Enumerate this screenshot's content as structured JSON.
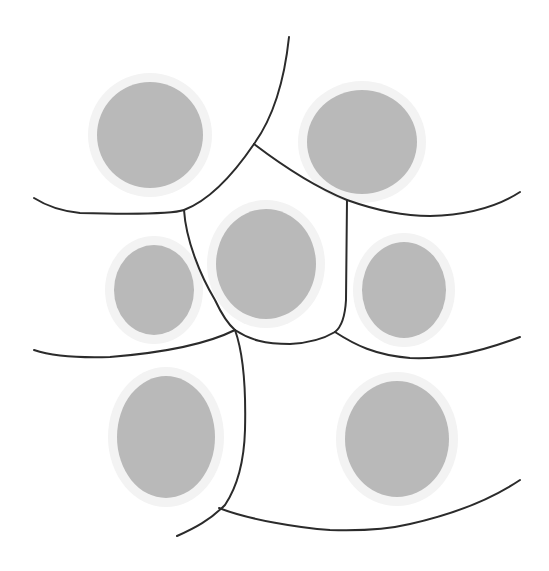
{
  "diagram": {
    "type": "cell-tessellation",
    "colors": {
      "background": "#ffffff",
      "nucleus_fill": "#b9b9b9",
      "halo_fill": "#f3f3f3",
      "boundary_stroke": "#2b2b2b"
    },
    "nuclei": [
      {
        "id": "top-left",
        "cx": 150,
        "cy": 135,
        "rx": 53,
        "ry": 53
      },
      {
        "id": "top-right",
        "cx": 362,
        "cy": 142,
        "rx": 55,
        "ry": 52
      },
      {
        "id": "center",
        "cx": 266,
        "cy": 264,
        "rx": 50,
        "ry": 55
      },
      {
        "id": "middle-left",
        "cx": 154,
        "cy": 290,
        "rx": 40,
        "ry": 45
      },
      {
        "id": "middle-right",
        "cx": 404,
        "cy": 290,
        "rx": 42,
        "ry": 48
      },
      {
        "id": "bottom-left",
        "cx": 166,
        "cy": 437,
        "rx": 49,
        "ry": 61
      },
      {
        "id": "bottom-right",
        "cx": 397,
        "cy": 439,
        "rx": 52,
        "ry": 58
      }
    ],
    "boundaries": [
      {
        "id": "top-divider",
        "d": "M289,37 C285,75 275,115 254,144"
      },
      {
        "id": "upper-left-arc",
        "d": "M254,144 C235,172 210,200 184,210 C170,215 120,214 80,213 C60,211 45,205 34,198"
      },
      {
        "id": "upper-right-arc",
        "d": "M254,144 C275,160 310,185 347,200 C375,210 400,216 430,216 C470,215 500,205 520,192"
      },
      {
        "id": "center-left-wall",
        "d": "M184,210 C186,240 200,275 215,300 C222,315 228,324 235,330"
      },
      {
        "id": "center-right-wall",
        "d": "M347,200 L346,300 C345,318 340,328 335,332"
      },
      {
        "id": "center-bottom",
        "d": "M235,330 C250,340 265,344 290,344 C310,343 325,338 335,332"
      },
      {
        "id": "middle-left-bottom",
        "d": "M34,350 C55,357 80,358 110,357 C160,353 205,345 235,330"
      },
      {
        "id": "middle-right-bottom",
        "d": "M335,332 C355,345 375,355 410,358 C440,359 470,356 520,337"
      },
      {
        "id": "lower-divider",
        "d": "M235,330 C244,355 246,390 245,430 C244,465 235,490 225,505 C210,520 195,528 177,536"
      },
      {
        "id": "bottom-arc",
        "d": "M219,508 C250,520 300,528 330,530 C360,531 385,530 410,524 C450,515 490,500 520,480"
      }
    ]
  }
}
